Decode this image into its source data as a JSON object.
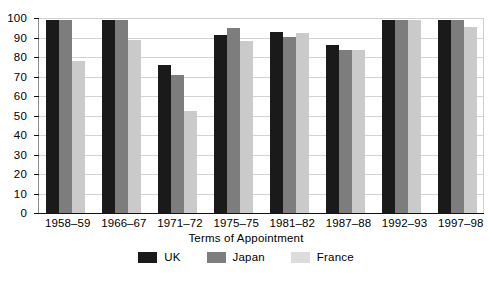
{
  "chart_data": {
    "type": "bar",
    "title": "",
    "xlabel": "Terms of Appointment",
    "ylabel": "",
    "ylim": [
      0,
      100
    ],
    "yticks": [
      0,
      10,
      20,
      30,
      40,
      50,
      60,
      70,
      80,
      90,
      100
    ],
    "grid": true,
    "legend_position": "bottom",
    "categories": [
      "1958–59",
      "1966–67",
      "1971–72",
      "1975–75",
      "1981–82",
      "1987–88",
      "1992–93",
      "1997–98"
    ],
    "series": [
      {
        "name": "UK",
        "color": "#1a1a1a",
        "values": [
          99,
          99,
          76,
          91.5,
          93,
          86,
          99,
          99
        ]
      },
      {
        "name": "Japan",
        "color": "#7d7d7d",
        "values": [
          99,
          99,
          71,
          95,
          90.5,
          83.5,
          99,
          99
        ]
      },
      {
        "name": "France",
        "color": "#cacaca",
        "values": [
          78,
          88.5,
          52.5,
          88,
          92.5,
          83.5,
          99,
          95.5
        ]
      }
    ]
  }
}
